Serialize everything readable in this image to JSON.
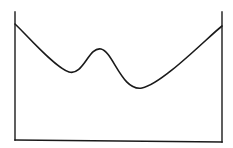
{
  "diagram": {
    "type": "potential-well-sketch",
    "background": "#ffffff",
    "stroke_color": "#1a1a1a",
    "box": {
      "left_wall": {
        "x": 15,
        "y_top": 12,
        "y_bottom": 140
      },
      "right_wall": {
        "x": 222,
        "y_top": 12,
        "y_bottom": 142
      },
      "bottom": {
        "x1": 15,
        "y1": 140,
        "x2": 222,
        "y2": 142
      }
    },
    "curve": {
      "description": "double-well curve with a central bump",
      "key_points": [
        {
          "label": "left-end",
          "x": 15,
          "y": 24
        },
        {
          "label": "left-minimum",
          "x": 69,
          "y": 72
        },
        {
          "label": "central-peak",
          "x": 101,
          "y": 49
        },
        {
          "label": "right-minimum",
          "x": 142,
          "y": 88
        },
        {
          "label": "right-end",
          "x": 222,
          "y": 26
        }
      ]
    }
  }
}
